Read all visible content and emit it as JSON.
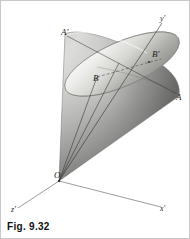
{
  "figure": {
    "caption": "Fig. 9.32",
    "background_color": "#ffffff",
    "border_color": "#c8c8c8",
    "ink_color": "#1a1a1a"
  },
  "solid": {
    "name": "oblique-elliptical-cone",
    "apex_label": "O",
    "shading": {
      "cone_light": "#e2e2e2",
      "cone_mid": "#9a9a9a",
      "cone_dark": "#6a6a6a",
      "ellipse_light": "#f2f2f0",
      "ellipse_mid": "#c9c9c6",
      "ellipse_dark": "#8e8e8a"
    }
  },
  "points": [
    {
      "id": "A-prime",
      "label": "A'",
      "x": 60,
      "y": 27
    },
    {
      "id": "B-prime",
      "label": "B'",
      "x": 151,
      "y": 49
    },
    {
      "id": "B",
      "label": "B",
      "x": 92,
      "y": 73
    },
    {
      "id": "A",
      "label": "A",
      "x": 175,
      "y": 92
    },
    {
      "id": "O",
      "label": "O",
      "x": 53,
      "y": 170
    }
  ],
  "axes": [
    {
      "id": "y-axis",
      "label": "y'",
      "x": 159,
      "y": 14
    },
    {
      "id": "z-axis",
      "label": "z'",
      "x": 10,
      "y": 205
    },
    {
      "id": "x-axis",
      "label": "x'",
      "x": 159,
      "y": 204
    }
  ]
}
